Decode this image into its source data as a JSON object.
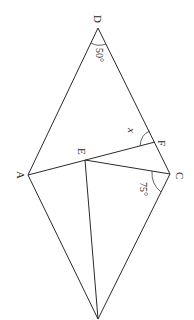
{
  "diagram": {
    "type": "geometry-figure",
    "rotation_note": "figure rendered rotated 90 degrees clockwise",
    "points": {
      "D": {
        "label": "D",
        "x": 98,
        "y": 28
      },
      "A": {
        "label": "A",
        "x": 28,
        "y": 175
      },
      "E": {
        "label": "E",
        "x": 85,
        "y": 160
      },
      "F": {
        "label": "F",
        "x": 155,
        "y": 142
      },
      "C": {
        "label": "C",
        "x": 170,
        "y": 174
      },
      "B": {
        "label": "",
        "x": 98,
        "y": 319
      }
    },
    "segments": [
      [
        "D",
        "A"
      ],
      [
        "D",
        "C"
      ],
      [
        "A",
        "B"
      ],
      [
        "C",
        "B"
      ],
      [
        "A",
        "F"
      ],
      [
        "E",
        "C"
      ],
      [
        "E",
        "B"
      ]
    ],
    "angles": {
      "D": {
        "label": "50°"
      },
      "C": {
        "label": "75°"
      },
      "F": {
        "label": "x"
      }
    }
  }
}
